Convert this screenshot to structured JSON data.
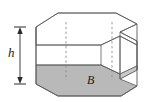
{
  "figure": {
    "kind": "geometry-diagram",
    "background_color": "#ffffff",
    "labels": {
      "height": "h",
      "base": "B"
    },
    "icons": {
      "height_dimension": "double-headed-arrow-icon",
      "hidden_edge": "dashed-line-icon"
    },
    "colors": {
      "base_fill": "#b9b9b9",
      "base_fill_light": "#c9c9c9",
      "edge_stroke": "#5a5a5a",
      "hidden_edge_stroke": "#9a9a9a",
      "arrow_stroke": "#2b2b2b",
      "label_color": "#1a1a1a"
    },
    "geometry": {
      "height_arrow": {
        "x": 20,
        "y_top": 27,
        "y_bottom": 84
      },
      "top_face_points": "36,27 58,13 116,13 137,24 121,33 137,41 137,44 119,36 101,45 36,45",
      "base_face_points": "36,84 58,96 121,96 137,86 119,79 137,70 137,67 121,75 101,66 36,66",
      "hidden_edges": [
        {
          "x": 66,
          "y1": 31,
          "y2": 82
        },
        {
          "x": 112,
          "y1": 22,
          "y2": 75
        }
      ]
    }
  }
}
